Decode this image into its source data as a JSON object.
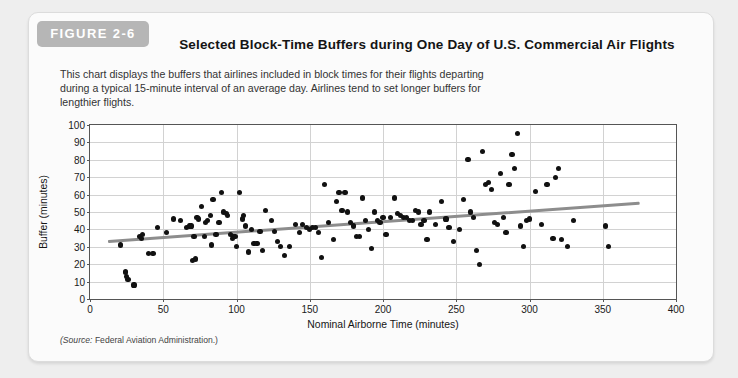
{
  "figure": {
    "badge": "FIGURE 2-6",
    "title": "Selected Block-Time Buffers during One Day of U.S. Commercial Air Flights",
    "description": "This chart displays the buffers that airlines included in block times for their flights departing during a typical 15-minute interval of an average day. Airlines tend to set longer buffers for lengthier flights.",
    "source_prefix": "(Source:",
    "source_text": "Federal Aviation Administration.)"
  },
  "colors": {
    "badge_bg": "#b6b6b6",
    "card_bg": "#fbfbfb",
    "page_bg": "#eeeeee",
    "dot": "#111111",
    "trendline": "#8d8d8d",
    "gridline": "#d2d2d2",
    "axis": "#555555"
  },
  "chart_data": {
    "type": "scatter",
    "title": "Selected Block-Time Buffers during One Day of U.S. Commercial Air Flights",
    "xlabel": "Nominal Airborne Time (minutes)",
    "ylabel": "Buffer (minutes)",
    "xlim": [
      0,
      400
    ],
    "ylim": [
      0,
      100
    ],
    "xticks": [
      0,
      50,
      100,
      150,
      200,
      250,
      300,
      350,
      400
    ],
    "yticks": [
      0,
      10,
      20,
      30,
      40,
      50,
      60,
      70,
      80,
      90,
      100
    ],
    "grid": true,
    "legend": "none",
    "series": [
      {
        "name": "Flights",
        "points": [
          [
            21,
            31
          ],
          [
            24,
            16
          ],
          [
            24,
            15
          ],
          [
            25,
            13
          ],
          [
            26,
            11
          ],
          [
            30,
            8
          ],
          [
            34,
            36
          ],
          [
            35,
            35
          ],
          [
            36,
            37
          ],
          [
            40,
            26
          ],
          [
            43,
            26
          ],
          [
            46,
            41
          ],
          [
            52,
            38
          ],
          [
            57,
            46
          ],
          [
            62,
            45
          ],
          [
            66,
            41
          ],
          [
            68,
            42
          ],
          [
            69,
            42
          ],
          [
            70,
            22
          ],
          [
            71,
            36
          ],
          [
            72,
            23
          ],
          [
            73,
            47
          ],
          [
            74,
            46
          ],
          [
            76,
            53
          ],
          [
            78,
            36
          ],
          [
            79,
            44
          ],
          [
            80,
            45
          ],
          [
            82,
            48
          ],
          [
            83,
            31
          ],
          [
            84,
            57
          ],
          [
            86,
            37
          ],
          [
            88,
            44
          ],
          [
            90,
            61
          ],
          [
            91,
            50
          ],
          [
            93,
            49
          ],
          [
            94,
            48
          ],
          [
            96,
            37
          ],
          [
            97,
            35
          ],
          [
            98,
            36
          ],
          [
            99,
            36
          ],
          [
            100,
            30
          ],
          [
            102,
            61
          ],
          [
            104,
            46
          ],
          [
            105,
            48
          ],
          [
            106,
            42
          ],
          [
            108,
            27
          ],
          [
            110,
            40
          ],
          [
            112,
            32
          ],
          [
            114,
            32
          ],
          [
            116,
            39
          ],
          [
            118,
            28
          ],
          [
            120,
            51
          ],
          [
            124,
            45
          ],
          [
            126,
            39
          ],
          [
            128,
            33
          ],
          [
            130,
            30
          ],
          [
            133,
            25
          ],
          [
            136,
            30
          ],
          [
            140,
            43
          ],
          [
            143,
            38
          ],
          [
            145,
            43
          ],
          [
            148,
            41
          ],
          [
            150,
            40
          ],
          [
            152,
            41
          ],
          [
            154,
            41
          ],
          [
            156,
            38
          ],
          [
            158,
            24
          ],
          [
            160,
            66
          ],
          [
            163,
            44
          ],
          [
            166,
            34
          ],
          [
            168,
            56
          ],
          [
            170,
            61
          ],
          [
            172,
            51
          ],
          [
            174,
            61
          ],
          [
            176,
            50
          ],
          [
            178,
            44
          ],
          [
            180,
            42
          ],
          [
            182,
            36
          ],
          [
            184,
            36
          ],
          [
            186,
            58
          ],
          [
            188,
            45
          ],
          [
            190,
            40
          ],
          [
            192,
            29
          ],
          [
            194,
            50
          ],
          [
            196,
            45
          ],
          [
            198,
            44
          ],
          [
            200,
            47
          ],
          [
            202,
            37
          ],
          [
            205,
            47
          ],
          [
            208,
            58
          ],
          [
            210,
            49
          ],
          [
            212,
            48
          ],
          [
            214,
            47
          ],
          [
            216,
            47
          ],
          [
            218,
            45
          ],
          [
            220,
            45
          ],
          [
            222,
            51
          ],
          [
            224,
            50
          ],
          [
            226,
            43
          ],
          [
            228,
            45
          ],
          [
            230,
            34
          ],
          [
            232,
            50
          ],
          [
            236,
            43
          ],
          [
            240,
            56
          ],
          [
            243,
            46
          ],
          [
            245,
            41
          ],
          [
            248,
            33
          ],
          [
            252,
            40
          ],
          [
            255,
            57
          ],
          [
            258,
            80
          ],
          [
            260,
            50
          ],
          [
            262,
            47
          ],
          [
            264,
            28
          ],
          [
            266,
            20
          ],
          [
            268,
            85
          ],
          [
            270,
            66
          ],
          [
            272,
            67
          ],
          [
            274,
            63
          ],
          [
            276,
            44
          ],
          [
            278,
            43
          ],
          [
            280,
            72
          ],
          [
            282,
            47
          ],
          [
            284,
            38
          ],
          [
            286,
            66
          ],
          [
            288,
            83
          ],
          [
            290,
            75
          ],
          [
            292,
            95
          ],
          [
            294,
            42
          ],
          [
            296,
            30
          ],
          [
            298,
            45
          ],
          [
            300,
            46
          ],
          [
            304,
            62
          ],
          [
            308,
            43
          ],
          [
            312,
            66
          ],
          [
            316,
            35
          ],
          [
            318,
            70
          ],
          [
            320,
            75
          ],
          [
            322,
            34
          ],
          [
            326,
            30
          ],
          [
            330,
            45
          ],
          [
            352,
            42
          ],
          [
            354,
            30
          ]
        ]
      }
    ],
    "trendline": {
      "name": "linear fit",
      "x_start": 12,
      "y_start": 34,
      "x_end": 375,
      "y_end": 56
    }
  }
}
